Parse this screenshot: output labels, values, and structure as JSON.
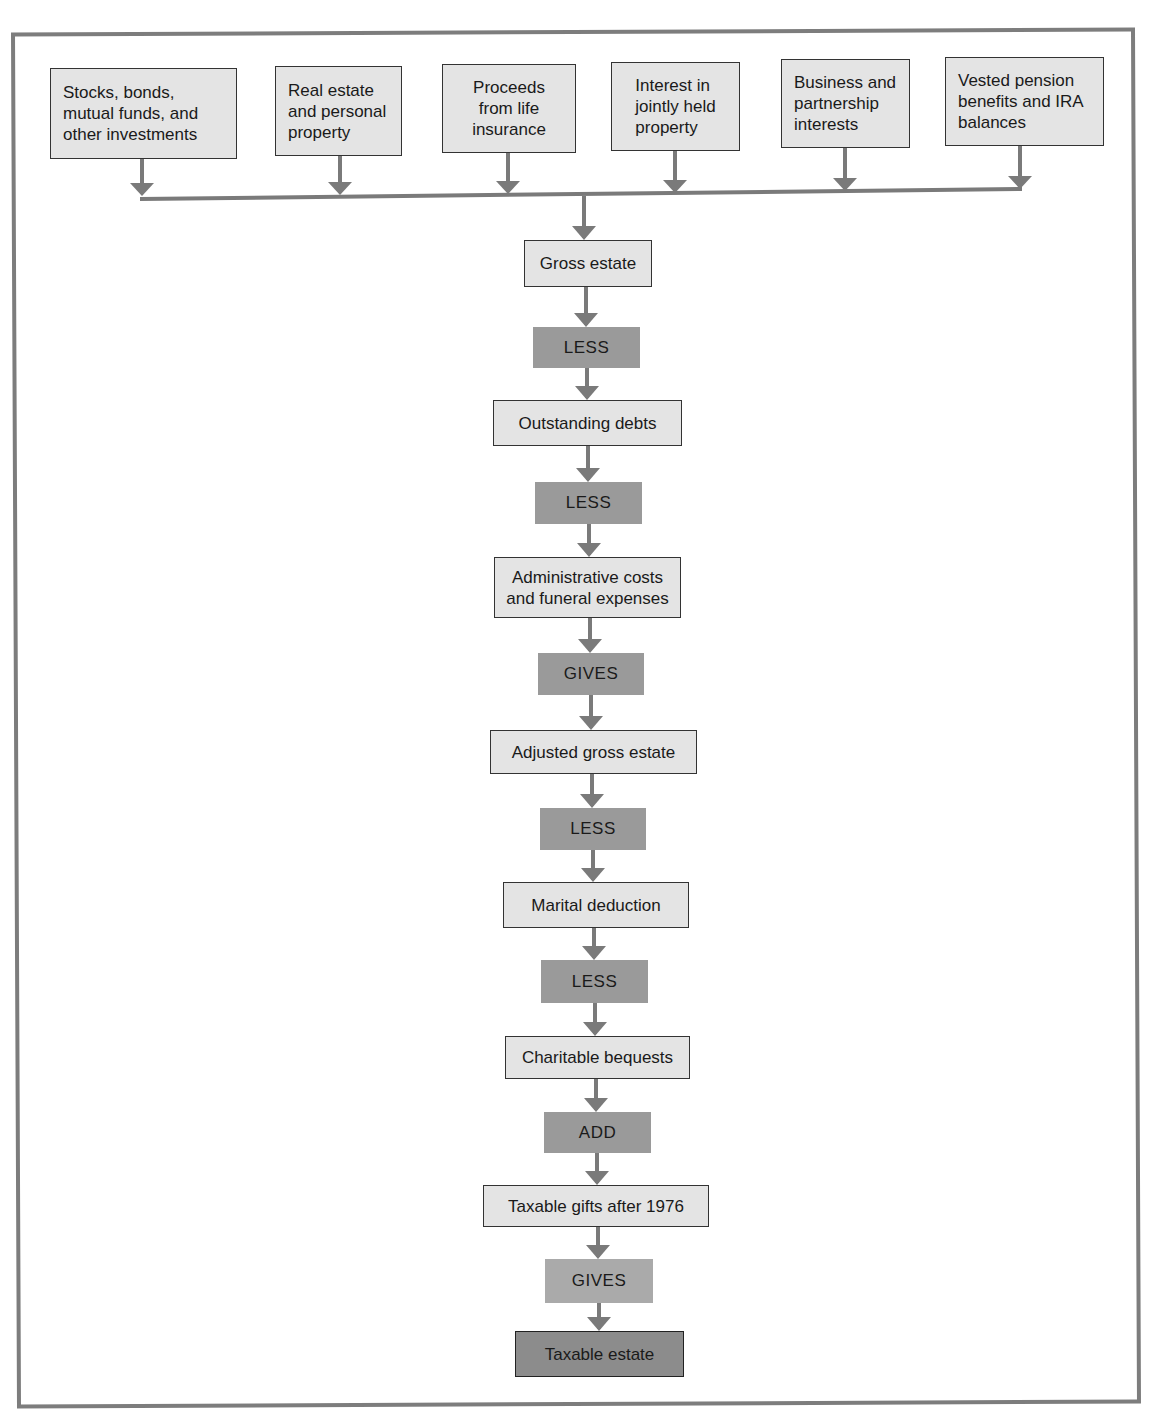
{
  "diagram": {
    "type": "flowchart",
    "sources": [
      {
        "label": "Stocks, bonds,\nmutual funds, and\nother investments"
      },
      {
        "label": "Real estate\nand personal\nproperty"
      },
      {
        "label": "Proceeds\nfrom life\ninsurance"
      },
      {
        "label": "Interest in\njointly held\nproperty"
      },
      {
        "label": "Business and\npartnership\ninterests"
      },
      {
        "label": "Vested pension\nbenefits and IRA\nbalances"
      }
    ],
    "steps": [
      {
        "kind": "value",
        "label": "Gross estate"
      },
      {
        "kind": "op",
        "label": "LESS"
      },
      {
        "kind": "value",
        "label": "Outstanding debts"
      },
      {
        "kind": "op",
        "label": "LESS"
      },
      {
        "kind": "value",
        "label": "Administrative costs\nand funeral expenses"
      },
      {
        "kind": "op",
        "label": "GIVES"
      },
      {
        "kind": "value",
        "label": "Adjusted gross estate"
      },
      {
        "kind": "op",
        "label": "LESS"
      },
      {
        "kind": "value",
        "label": "Marital deduction"
      },
      {
        "kind": "op",
        "label": "LESS"
      },
      {
        "kind": "value",
        "label": "Charitable bequests"
      },
      {
        "kind": "op",
        "label": "ADD"
      },
      {
        "kind": "value",
        "label": "Taxable gifts after 1976"
      },
      {
        "kind": "op",
        "label": "GIVES"
      },
      {
        "kind": "result",
        "label": "Taxable estate"
      }
    ],
    "colors": {
      "frame": "#7d7d7d",
      "box_fill": "#e4e4e4",
      "op_fill": "#9a9a9a",
      "result_fill": "#8c8c8c",
      "arrow": "#7a7a7a"
    }
  }
}
